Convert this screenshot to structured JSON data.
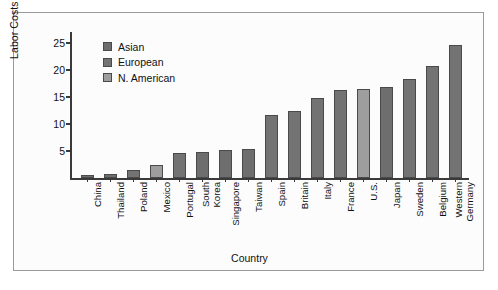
{
  "chart_data": {
    "type": "bar",
    "title": "",
    "xlabel": "Country",
    "ylabel": "Labor Costs $",
    "ylim": [
      0,
      27
    ],
    "yticks": [
      5,
      10,
      15,
      20,
      25
    ],
    "grid": false,
    "legend_position": "upper-left-inside",
    "categories": [
      "China",
      "Thailand",
      "Poland",
      "Mexico",
      "Portugal",
      "South Korea",
      "Singapore",
      "Taiwan",
      "Spain",
      "Britain",
      "Italy",
      "France",
      "U.S.",
      "Japan",
      "Sweden",
      "Belgium",
      "Western Germany"
    ],
    "values": [
      0.6,
      0.7,
      1.5,
      2.4,
      4.6,
      4.9,
      5.1,
      5.4,
      11.6,
      12.4,
      14.8,
      16.3,
      16.4,
      16.9,
      18.3,
      20.8,
      24.6
    ],
    "groups": [
      "Asian",
      "Asian",
      "European",
      "N. American",
      "European",
      "Asian",
      "Asian",
      "Asian",
      "European",
      "European",
      "European",
      "European",
      "N. American",
      "Asian",
      "European",
      "European",
      "European"
    ],
    "legend": [
      {
        "label": "Asian",
        "key": "asian",
        "color": "#6e6e6e"
      },
      {
        "label": "European",
        "key": "european",
        "color": "#737373"
      },
      {
        "label": "N. American",
        "key": "namerican",
        "color": "#9e9e9e"
      }
    ],
    "colors": {
      "asian": "#6e6e6e",
      "european": "#737373",
      "namerican": "#9e9e9e",
      "axis": "#3a3a3a",
      "border": "#9a9a9a",
      "background": "#fcfcfc",
      "text": "#111111"
    }
  }
}
